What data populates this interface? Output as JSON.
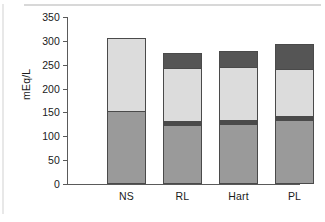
{
  "chart_data": {
    "type": "bar",
    "subtype": "stacked-bar",
    "title": "",
    "xlabel": "",
    "ylabel": "mEq/L",
    "ylim": [
      0,
      350
    ],
    "yticks": [
      0,
      50,
      100,
      150,
      200,
      250,
      300,
      350
    ],
    "ytick_labels": [
      "0",
      "50",
      "100",
      "150",
      "200",
      "250",
      "300",
      "350"
    ],
    "grid": false,
    "legend": "none",
    "categories": [
      "NS",
      "RL",
      "Hart",
      "PL"
    ],
    "series": [
      {
        "name": "segment-1",
        "color": "#9a9a9a",
        "values": [
          151,
          122,
          124,
          132
        ]
      },
      {
        "name": "segment-2",
        "color": "#4a4a4a",
        "values": [
          0,
          8,
          8,
          8
        ]
      },
      {
        "name": "segment-3",
        "color": "#dcdcdc",
        "values": [
          156,
          113,
          113,
          101
        ]
      },
      {
        "name": "segment-4",
        "color": "#555555",
        "values": [
          0,
          32,
          34,
          53
        ]
      }
    ],
    "totals": [
      307,
      275,
      279,
      294
    ]
  },
  "colors": {
    "segment_1": "#9a9a9a",
    "segment_2": "#4a4a4a",
    "segment_3": "#dcdcdc",
    "segment_4": "#555555",
    "axis": "#5a5a5a",
    "text": "#1a1a1a",
    "background": "#ffffff"
  }
}
